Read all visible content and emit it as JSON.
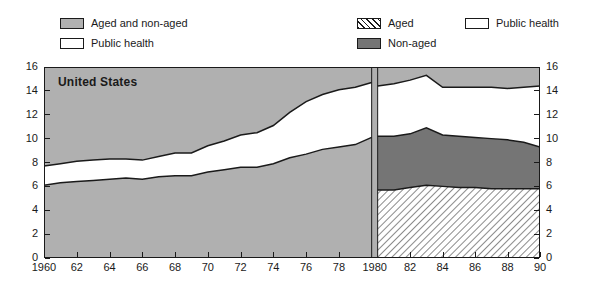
{
  "legend": {
    "left": [
      {
        "label": "Aged and non-aged",
        "swatch": "aged-and-non-aged",
        "color": "#b0b0b0"
      },
      {
        "label": "Public health",
        "swatch": "public-health",
        "color": "#ffffff"
      }
    ],
    "right": [
      {
        "label": "Aged",
        "swatch": "aged-hatched",
        "color": "#ffffff"
      },
      {
        "label": "Non-aged",
        "swatch": "non-aged",
        "color": "#757575"
      },
      {
        "label": "Public health",
        "swatch": "public-health",
        "color": "#ffffff"
      }
    ]
  },
  "chart_data": {
    "type": "area",
    "title": "United States",
    "xlabel": "",
    "ylabel": "",
    "xlim": [
      1960,
      1990
    ],
    "ylim": [
      0,
      16
    ],
    "yticks": [
      0,
      2,
      4,
      6,
      8,
      10,
      12,
      14,
      16
    ],
    "ytick_labels": [
      "0",
      "2",
      "4",
      "6",
      "8",
      "10",
      "12",
      "14",
      "16"
    ],
    "xticks": [
      1960,
      1962,
      1964,
      1966,
      1968,
      1970,
      1972,
      1974,
      1976,
      1978,
      1980,
      1982,
      1984,
      1986,
      1988,
      1990
    ],
    "xtick_labels": [
      "1960",
      "62",
      "64",
      "66",
      "68",
      "70",
      "72",
      "74",
      "76",
      "78",
      "1980",
      "82",
      "84",
      "86",
      "88",
      "90"
    ],
    "grid": false,
    "legend_position": "above-plot",
    "background_color": "#b0b0b0",
    "panels": [
      {
        "name": "left-panel",
        "x_range": [
          1960,
          1980
        ],
        "series": [
          {
            "name": "Aged and non-aged",
            "fill": "#b0b0b0",
            "x": [
              1960,
              1961,
              1962,
              1963,
              1964,
              1965,
              1966,
              1967,
              1968,
              1969,
              1970,
              1971,
              1972,
              1973,
              1974,
              1975,
              1976,
              1977,
              1978,
              1979,
              1980
            ],
            "values": [
              6.1,
              6.3,
              6.4,
              6.5,
              6.6,
              6.7,
              6.6,
              6.8,
              6.9,
              6.9,
              7.2,
              7.4,
              7.6,
              7.6,
              7.9,
              8.4,
              8.7,
              9.1,
              9.3,
              9.5,
              10.1
            ]
          },
          {
            "name": "Public health",
            "fill": "#ffffff",
            "x": [
              1960,
              1961,
              1962,
              1963,
              1964,
              1965,
              1966,
              1967,
              1968,
              1969,
              1970,
              1971,
              1972,
              1973,
              1974,
              1975,
              1976,
              1977,
              1978,
              1979,
              1980
            ],
            "values": [
              7.7,
              7.9,
              8.1,
              8.2,
              8.3,
              8.3,
              8.2,
              8.5,
              8.8,
              8.8,
              9.4,
              9.8,
              10.3,
              10.5,
              11.1,
              12.2,
              13.1,
              13.7,
              14.1,
              14.3,
              14.7
            ]
          }
        ]
      },
      {
        "name": "right-panel",
        "x_range": [
          1980,
          1990
        ],
        "series": [
          {
            "name": "Aged",
            "fill": "#ffffff",
            "hatch": "diagonal",
            "x": [
              1980,
              1981,
              1982,
              1983,
              1984,
              1985,
              1986,
              1987,
              1988,
              1989,
              1990
            ],
            "values": [
              5.7,
              5.7,
              5.9,
              6.1,
              6.0,
              5.9,
              5.9,
              5.8,
              5.8,
              5.8,
              5.8
            ]
          },
          {
            "name": "Non-aged",
            "fill": "#757575",
            "x": [
              1980,
              1981,
              1982,
              1983,
              1984,
              1985,
              1986,
              1987,
              1988,
              1989,
              1990
            ],
            "values": [
              10.2,
              10.2,
              10.4,
              10.9,
              10.3,
              10.2,
              10.1,
              10.0,
              9.9,
              9.7,
              9.3
            ]
          },
          {
            "name": "Public health",
            "fill": "#ffffff",
            "x": [
              1980,
              1981,
              1982,
              1983,
              1984,
              1985,
              1986,
              1987,
              1988,
              1989,
              1990
            ],
            "values": [
              14.4,
              14.6,
              14.9,
              15.3,
              14.3,
              14.3,
              14.3,
              14.3,
              14.2,
              14.3,
              14.4
            ]
          }
        ]
      }
    ]
  }
}
